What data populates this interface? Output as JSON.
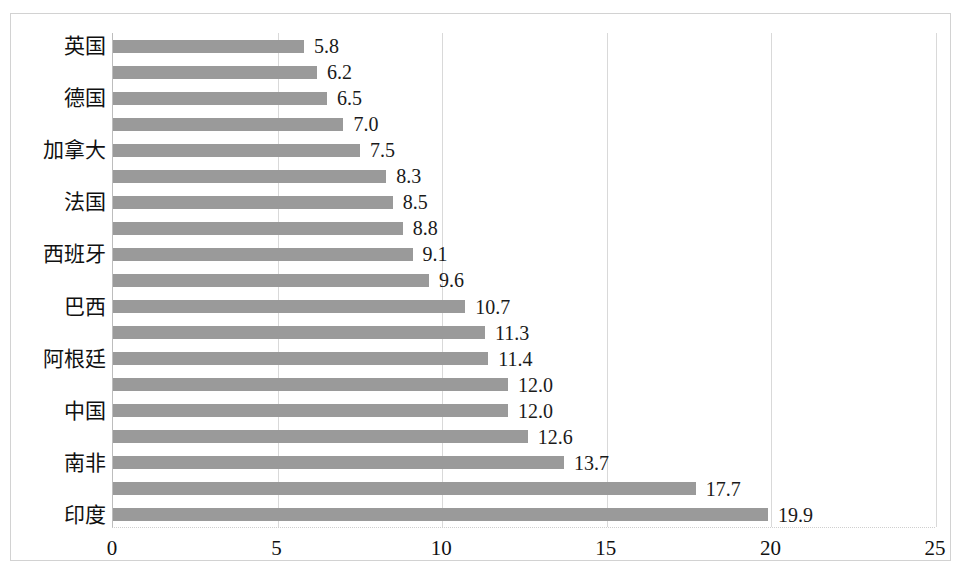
{
  "chart_data": {
    "type": "bar",
    "orientation": "horizontal",
    "title": "",
    "subtitle": "",
    "xlabel": "",
    "ylabel": "",
    "xlim": [
      0,
      25
    ],
    "xticks": [
      "0",
      "5",
      "10",
      "15",
      "20",
      "25"
    ],
    "xtick_values": [
      0,
      5,
      10,
      15,
      20,
      25
    ],
    "grid": true,
    "grid_axis": "x",
    "legend": false,
    "legend_position": "none",
    "series_color": "#9a9a9a",
    "gridline_color": "#d9d9d9",
    "axis_color": "#bdbdbd",
    "bar_count": 19,
    "categories": [
      "英国",
      "",
      "德国",
      "",
      "加拿大",
      "",
      "法国",
      "",
      "西班牙",
      "",
      "巴西",
      "",
      "阿根廷",
      "",
      "中国",
      "",
      "南非",
      "",
      "印度"
    ],
    "visible_category_labels": [
      "英国",
      "德国",
      "加拿大",
      "法国",
      "西班牙",
      "巴西",
      "阿根廷",
      "中国",
      "南非",
      "印度"
    ],
    "values": [
      5.8,
      6.2,
      6.5,
      7.0,
      7.5,
      8.3,
      8.5,
      8.8,
      9.1,
      9.6,
      10.7,
      11.3,
      11.4,
      12.0,
      12.0,
      12.6,
      13.7,
      17.7,
      19.9
    ],
    "value_labels": [
      "5.8",
      "6.2",
      "6.5",
      "7.0",
      "7.5",
      "8.3",
      "8.5",
      "8.8",
      "9.1",
      "9.6",
      "10.7",
      "11.3",
      "11.4",
      "12.0",
      "12.0",
      "12.6",
      "13.7",
      "17.7",
      "19.9"
    ]
  }
}
